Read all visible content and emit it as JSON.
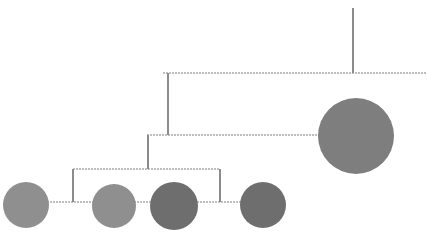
{
  "figure": {
    "title": "",
    "type": "dendrogram-bubble-plot",
    "background_color": "#ffffff",
    "width": 427,
    "height": 251
  },
  "style": {
    "link_color": "#bfbfbf",
    "link_color_vertical": "#8c8c8c",
    "link_width": 1.5,
    "node_colors": {
      "light_gray": "#8f8f8f",
      "mid_gray": "#7e7e7e",
      "dark_gray": "#6e6e6e"
    }
  },
  "chart_data": {
    "type": "scatter",
    "title": "",
    "xlabel": "",
    "ylabel": "",
    "grid": false,
    "legend": null,
    "nodes": [
      {
        "id": "n1",
        "label": "",
        "cx": 26,
        "cy": 205,
        "r": 23,
        "color": "#8f8f8f"
      },
      {
        "id": "n2",
        "label": "",
        "cx": 114,
        "cy": 206,
        "r": 22,
        "color": "#8f8f8f"
      },
      {
        "id": "n3",
        "label": "",
        "cx": 174,
        "cy": 206,
        "r": 24,
        "color": "#6e6e6e"
      },
      {
        "id": "n4",
        "label": "",
        "cx": 263,
        "cy": 205,
        "r": 23,
        "color": "#6e6e6e"
      },
      {
        "id": "n5",
        "label": "",
        "cx": 356,
        "cy": 136,
        "r": 38,
        "color": "#7e7e7e"
      }
    ],
    "links": [
      {
        "id": "h-bottom",
        "orientation": "horizontal",
        "y": 202,
        "x1": 26,
        "x2": 263,
        "style": "dotted"
      },
      {
        "id": "h-level3",
        "orientation": "horizontal",
        "y": 169,
        "x1": 73,
        "x2": 220,
        "style": "dotted"
      },
      {
        "id": "h-level2",
        "orientation": "horizontal",
        "y": 135,
        "x1": 147,
        "x2": 320,
        "style": "dotted"
      },
      {
        "id": "h-level1",
        "orientation": "horizontal",
        "y": 73,
        "x1": 163,
        "x2": 427,
        "style": "dotted"
      },
      {
        "id": "v-left-leaf",
        "orientation": "vertical",
        "x": 73,
        "y1": 169,
        "y2": 202,
        "style": "solid"
      },
      {
        "id": "v-right-leaf",
        "orientation": "vertical",
        "x": 220,
        "y1": 169,
        "y2": 202,
        "style": "solid"
      },
      {
        "id": "v-mid-branch",
        "orientation": "vertical",
        "x": 148,
        "y1": 135,
        "y2": 169,
        "style": "solid"
      },
      {
        "id": "v-upper-branch",
        "orientation": "vertical",
        "x": 168,
        "y1": 73,
        "y2": 135,
        "style": "solid"
      },
      {
        "id": "v-root-stem",
        "orientation": "vertical",
        "x": 353,
        "y1": 8,
        "y2": 73,
        "style": "solid"
      }
    ],
    "axis_ranges": {
      "x": [
        0,
        427
      ],
      "y": [
        0,
        251
      ]
    }
  }
}
